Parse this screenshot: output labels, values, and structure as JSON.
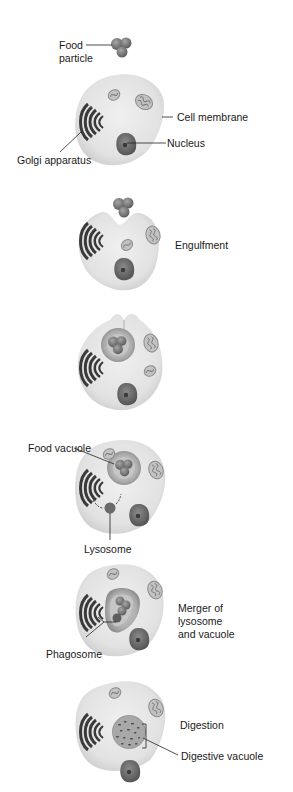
{
  "diagram": {
    "type": "process-sequence",
    "colors": {
      "cytoplasm": "#e3e3e3",
      "cytoplasm_edge": "#cfcfcf",
      "golgi": "#3c3c3c",
      "nucleus": "#6e6e6e",
      "nucleolus": "#3a3a3a",
      "mitochondria": "#a8a8a8",
      "food": "#7a7a7a",
      "vacuole_ring": "#8f8f8f",
      "leader": "#222222"
    },
    "stages": [
      {
        "id": "stage-1",
        "labels": {
          "food_particle_line1": "Food",
          "food_particle_line2": "particle",
          "cell_membrane": "Cell membrane",
          "nucleus": "Nucleus",
          "golgi": "Golgi apparatus"
        }
      },
      {
        "id": "stage-2",
        "labels": {
          "step": "Engulfment"
        }
      },
      {
        "id": "stage-3",
        "labels": {}
      },
      {
        "id": "stage-4",
        "labels": {
          "food_vacuole": "Food vacuole",
          "lysosome": "Lysosome"
        }
      },
      {
        "id": "stage-5",
        "labels": {
          "step_line1": "Merger of",
          "step_line2": "lysosome",
          "step_line3": "and vacuole",
          "phagosome": "Phagosome"
        }
      },
      {
        "id": "stage-6",
        "labels": {
          "step": "Digestion",
          "digestive_vacuole": "Digestive vacuole"
        }
      }
    ]
  }
}
